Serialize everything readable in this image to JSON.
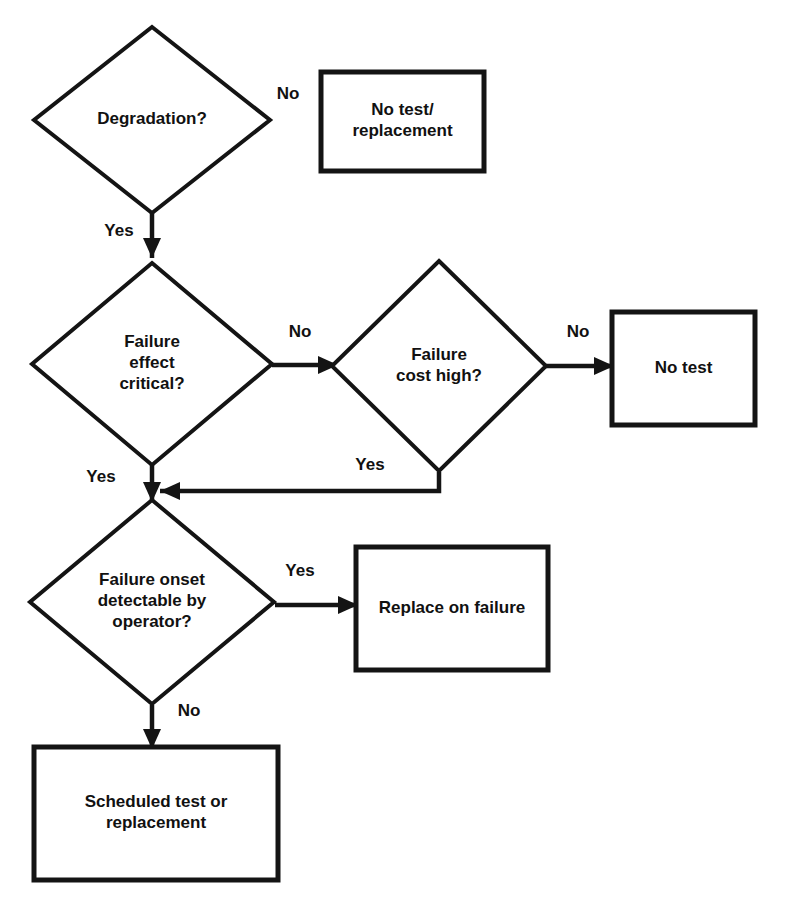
{
  "diagram": {
    "kind": "decision-flowchart",
    "colors": {
      "background": "#ffffff",
      "stroke": "#141414",
      "text": "#111111"
    },
    "nodes": [
      {
        "id": "degradation",
        "type": "decision",
        "lines": [
          "Degradation?"
        ],
        "cx": 152,
        "cy": 120,
        "rx": 118,
        "ry": 93
      },
      {
        "id": "no-test-replacement",
        "type": "process",
        "lines": [
          "No test/",
          "replacement"
        ],
        "x": 321,
        "y": 72,
        "w": 163,
        "h": 99
      },
      {
        "id": "failure-effect-critical",
        "type": "decision",
        "lines": [
          "Failure",
          "effect",
          "critical?"
        ],
        "cx": 152,
        "cy": 364,
        "rx": 120,
        "ry": 101
      },
      {
        "id": "failure-cost-high",
        "type": "decision",
        "lines": [
          "Failure",
          "cost high?"
        ],
        "cx": 439,
        "cy": 366,
        "rx": 107,
        "ry": 105
      },
      {
        "id": "no-test",
        "type": "process",
        "lines": [
          "No test"
        ],
        "x": 612,
        "y": 312,
        "w": 143,
        "h": 113
      },
      {
        "id": "failure-onset-detectable",
        "type": "decision",
        "lines": [
          "Failure onset",
          "detectable by",
          "operator?"
        ],
        "cx": 152,
        "cy": 602,
        "rx": 122,
        "ry": 102
      },
      {
        "id": "replace-on-failure",
        "type": "process",
        "lines": [
          "Replace on failure"
        ],
        "x": 356,
        "y": 547,
        "w": 192,
        "h": 123
      },
      {
        "id": "scheduled-test-or-replacement",
        "type": "process",
        "lines": [
          "Scheduled test or",
          "replacement"
        ],
        "x": 34,
        "y": 747,
        "w": 244,
        "h": 133
      }
    ],
    "edges": [
      {
        "id": "degradation-no",
        "from": "degradation",
        "to": "no-test-replacement",
        "label": "No",
        "label_x": 288,
        "label_y": 95,
        "has_line": false,
        "points": []
      },
      {
        "id": "degradation-yes",
        "from": "degradation",
        "to": "failure-effect-critical",
        "label": "Yes",
        "label_x": 119,
        "label_y": 232,
        "has_line": true,
        "arrow": "down",
        "points": [
          [
            152,
            213
          ],
          [
            152,
            258
          ]
        ]
      },
      {
        "id": "effect-critical-no",
        "from": "failure-effect-critical",
        "to": "failure-cost-high",
        "label": "No",
        "label_x": 300,
        "label_y": 333,
        "has_line": true,
        "arrow": "right",
        "points": [
          [
            272,
            365
          ],
          [
            338,
            365
          ]
        ]
      },
      {
        "id": "cost-high-no",
        "from": "failure-cost-high",
        "to": "no-test",
        "label": "No",
        "label_x": 578,
        "label_y": 333,
        "has_line": true,
        "arrow": "right",
        "points": [
          [
            546,
            366
          ],
          [
            614,
            366
          ]
        ]
      },
      {
        "id": "cost-high-yes",
        "from": "failure-cost-high",
        "to": "failure-onset-detectable",
        "label": "Yes",
        "label_x": 370,
        "label_y": 466,
        "has_line": true,
        "arrow": "left",
        "points": [
          [
            439,
            472
          ],
          [
            439,
            491
          ],
          [
            160,
            491
          ]
        ]
      },
      {
        "id": "effect-critical-yes",
        "from": "failure-effect-critical",
        "to": "failure-onset-detectable",
        "label": "Yes",
        "label_x": 101,
        "label_y": 478,
        "has_line": true,
        "arrow": "down",
        "points": [
          [
            152,
            463
          ],
          [
            152,
            502
          ]
        ]
      },
      {
        "id": "onset-detectable-yes",
        "from": "failure-onset-detectable",
        "to": "replace-on-failure",
        "label": "Yes",
        "label_x": 300,
        "label_y": 572,
        "has_line": true,
        "arrow": "right",
        "points": [
          [
            275,
            605
          ],
          [
            358,
            605
          ]
        ]
      },
      {
        "id": "onset-detectable-no",
        "from": "failure-onset-detectable",
        "to": "scheduled-test-or-replacement",
        "label": "No",
        "label_x": 189,
        "label_y": 712,
        "has_line": true,
        "arrow": "down",
        "points": [
          [
            152,
            705
          ],
          [
            152,
            749
          ]
        ]
      }
    ]
  }
}
